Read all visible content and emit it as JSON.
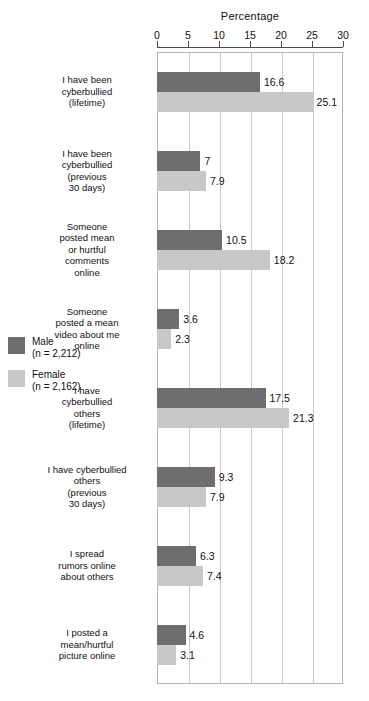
{
  "chart_data": {
    "type": "bar",
    "orientation": "horizontal",
    "title": "Percentage",
    "xlabel": "Percentage",
    "ylabel": "",
    "xlim": [
      0,
      30
    ],
    "xticks": [
      0,
      5,
      10,
      15,
      20,
      25,
      30
    ],
    "xtick_labels": [
      "0",
      "5",
      "10",
      "15",
      "20",
      "25",
      "30"
    ],
    "grid": true,
    "grid_axis": "x",
    "legend_position": "left-middle",
    "categories": [
      "I have been cyberbullied (lifetime)",
      "I have been cyberbullied (previous 30 days)",
      "Someone posted mean or hurtful comments online",
      "Someone posted a mean video about me online",
      "I have cyberbullied others (lifetime)",
      "I have cyberbullied others (previous 30 days)",
      "I spread rumors online about others",
      "I posted a mean/hurtful picture online"
    ],
    "category_lines": [
      [
        "I have been",
        "cyberbullied",
        "(lifetime)"
      ],
      [
        "I have been",
        "cyberbullied",
        "(previous",
        "30 days)"
      ],
      [
        "Someone",
        "posted mean",
        "or hurtful",
        "comments",
        "online"
      ],
      [
        "Someone",
        "posted a mean",
        "video about me",
        "online"
      ],
      [
        "I have",
        "cyberbullied",
        "others",
        "(lifetime)"
      ],
      [
        "I have cyberbullied",
        "others",
        "(previous",
        "30 days)"
      ],
      [
        "I spread",
        "rumors online",
        "about others"
      ],
      [
        "I posted a",
        "mean/hurtful",
        "picture online"
      ]
    ],
    "series": [
      {
        "name": "Male",
        "legend_label": "Male",
        "legend_n": "(n = 2,212)",
        "color": "#6e6e6e",
        "values": [
          16.6,
          7,
          10.5,
          3.6,
          17.5,
          9.3,
          6.3,
          4.6
        ],
        "value_labels": [
          "16.6",
          "7",
          "10.5",
          "3.6",
          "17.5",
          "9.3",
          "6.3",
          "4.6"
        ]
      },
      {
        "name": "Female",
        "legend_label": "Female",
        "legend_n": "(n = 2,162)",
        "color": "#c8c8c8",
        "values": [
          25.1,
          7.9,
          18.2,
          2.3,
          21.3,
          7.9,
          7.4,
          3.1
        ],
        "value_labels": [
          "25.1",
          "7.9",
          "18.2",
          "2.3",
          "21.3",
          "7.9",
          "7.4",
          "3.1"
        ]
      }
    ]
  }
}
